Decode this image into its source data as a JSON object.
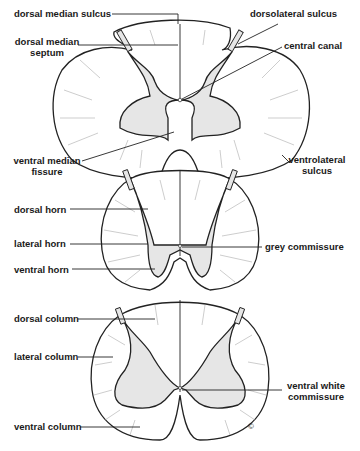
{
  "sections": [
    {
      "id": "top",
      "labels": {
        "dorsal_median_sulcus": "dorsal median sulcus",
        "dorsolateral_sulcus": "dorsolateral sulcus",
        "dorsal_median_septum_1": "dorsal median",
        "dorsal_median_septum_2": "septum",
        "central_canal": "central canal",
        "ventral_median_fissure_1": "ventral median",
        "ventral_median_fissure_2": "fissure",
        "ventrolateral_sulcus_1": "ventrolateral",
        "ventrolateral_sulcus_2": "sulcus"
      }
    },
    {
      "id": "middle",
      "labels": {
        "dorsal_horn": "dorsal horn",
        "lateral_horn": "lateral horn",
        "ventral_horn": "ventral horn",
        "grey_commissure": "grey commissure"
      }
    },
    {
      "id": "bottom",
      "labels": {
        "dorsal_column": "dorsal column",
        "lateral_column": "lateral column",
        "ventral_column": "ventral column",
        "ventral_white_commissure_1": "ventral white",
        "ventral_white_commissure_2": "commissure"
      },
      "copyright_mark": "©"
    }
  ],
  "colors": {
    "grey_matter": "#e6e6e6",
    "outline": "#222222",
    "text": "#1a1a1a"
  }
}
